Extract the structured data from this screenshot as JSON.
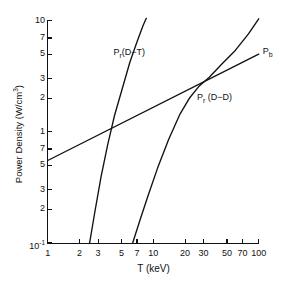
{
  "chart_data": {
    "type": "line",
    "title": "",
    "xlabel": "T (keV)",
    "ylabel": "Power Density (W/cm3)",
    "ylabel_display": "Power Density (W/cm³)",
    "xscale": "log",
    "yscale": "log",
    "xlim": [
      1,
      100
    ],
    "ylim": [
      0.1,
      10
    ],
    "grid": false,
    "legend": "inline-curve-labels",
    "x_ticks": [
      "1",
      "2",
      "3",
      "5",
      "7",
      "10",
      "20",
      "30",
      "50",
      "70",
      "100"
    ],
    "x_tick_values": [
      1,
      2,
      3,
      5,
      7,
      10,
      20,
      30,
      50,
      70,
      100
    ],
    "y_ticks": [
      "10",
      "7",
      "5",
      "3",
      "2",
      "1",
      "7",
      "5",
      "3",
      "2",
      "10-1"
    ],
    "y_tick_display": [
      "10",
      "7",
      "5",
      "3",
      "2",
      "1",
      "7",
      "5",
      "3",
      "2",
      "10⁻¹"
    ],
    "y_tick_values": [
      10,
      7,
      5,
      3,
      2,
      1,
      0.7,
      0.5,
      0.3,
      0.2,
      0.1
    ],
    "series": [
      {
        "name": "Pr(D-T)",
        "label_display": "P<sub>r</sub>(D−T)",
        "label_x": 4.2,
        "label_y": 5.2,
        "x": [
          2.5,
          2.8,
          3.2,
          3.7,
          4.3,
          5.0,
          6.0,
          7.0,
          8.0,
          8.6
        ],
        "y": [
          0.1,
          0.19,
          0.39,
          0.76,
          1.4,
          2.3,
          4.2,
          6.4,
          9.0,
          10.5
        ]
      },
      {
        "name": "Pr(D-D)",
        "label_display": "P<sub>r</sub> (D−D)",
        "label_x": 26,
        "label_y": 2.05,
        "x": [
          6.4,
          7.5,
          9.0,
          11.0,
          14.0,
          18.0,
          22.0,
          27.0,
          34.0,
          45.0,
          60.0,
          80.0,
          100.0
        ],
        "y": [
          0.1,
          0.16,
          0.27,
          0.47,
          0.85,
          1.45,
          2.0,
          2.55,
          3.1,
          4.1,
          5.4,
          7.6,
          10.4
        ]
      },
      {
        "name": "Pb",
        "label_display": "P<sub>b</sub>",
        "label_x": 106,
        "label_y": 5.3,
        "x": [
          1,
          100
        ],
        "y": [
          0.55,
          5.0
        ]
      }
    ],
    "annotations": [
      {
        "text": "Pr(D-T) crosses Pb",
        "x": 4.1,
        "y": 1.1
      },
      {
        "text": "Pr(D-D) crosses Pb",
        "x": 37,
        "y": 3.05
      }
    ]
  }
}
